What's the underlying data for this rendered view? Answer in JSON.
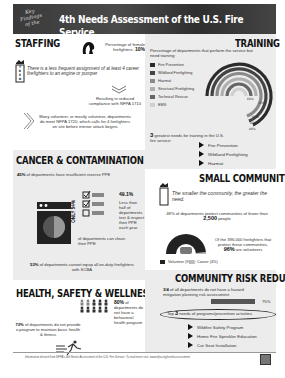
{
  "header": {
    "kicker": "Key Findings of the",
    "title": "4th Needs Assessment of the U.S. Fire Service"
  },
  "staffing": {
    "title": "STAFFING",
    "female_label": "Percentage of female firefighters:",
    "female_value": "10%",
    "trend_badge": "TREND",
    "trend_text": "There is a less frequent assignment of at least 4 career firefighters to an engine or pumper",
    "result_text": "Resulting in reduced compliance with NFPA 1710",
    "volunteer_text": "Many volunteer, or mostly volunteer, departments do meet NFPA 1720, which calls for 4 firefighters on site before interior attack begins"
  },
  "training": {
    "title": "TRAINING",
    "subtitle": "Percentage of departments that perform the service but need training:",
    "legend": [
      {
        "label": "Fire Prevention",
        "color": "#2b2b2b"
      },
      {
        "label": "Wildland Firefighting",
        "color": "#444444"
      },
      {
        "label": "Hazmat",
        "color": "#8a8a8a"
      },
      {
        "label": "Structural Firefighting",
        "color": "#b0b0b0"
      },
      {
        "label": "Technical Rescue",
        "color": "#666666"
      },
      {
        "label": "EMS",
        "color": "#d0d0d0"
      }
    ],
    "ring_values": [
      "86%",
      "85%",
      "83%",
      "68%",
      "63%",
      "58%"
    ],
    "greatest_prefix": "3",
    "greatest_text": "greatest needs for training in the U.S. fire service:",
    "greatest_items": [
      "Fire Prevention",
      "Wildland Firefighting",
      "Hazmat"
    ]
  },
  "cancer": {
    "title": "CANCER & CONTAMINATION",
    "reserve_value": "45%",
    "reserve_text": "of departments have insufficient reserve PPE",
    "checklist_value": "49.1%",
    "checklist_text": "Less than half of departments test & inspect their PPE each year",
    "clean_value": "ONLY 54%",
    "clean_text": "of departments can clean their PPE",
    "scba_value": "53%",
    "scba_text": "of departments cannot equip all on-duty firefighters with SCBA"
  },
  "small_communities": {
    "title": "SMALL COMMUNITIES",
    "trend_badge": "TREND",
    "trend_text": "The smaller the community, the greater the need.",
    "protect_prefix": "48% of departments protect communities of fewer than",
    "protect_value": "2,500",
    "protect_suffix": "people",
    "legend": [
      {
        "label": "Volunteer (96%)",
        "color": "#222222"
      },
      {
        "label": "Career (4%)",
        "color": "#bbbbbb"
      }
    ],
    "volunteer_prefix": "Of the 396,000 firefighters that protect these communities,",
    "volunteer_value": "96%",
    "volunteer_suffix": "are volunteers"
  },
  "health": {
    "title": "HEALTH, SAFETY & WELLNESS",
    "behavioral_value": "80%",
    "behavioral_text": "of departments do not have a behavioral health program",
    "fitness_value": "73%",
    "fitness_text": "of departments do not provide a program to maintain basic health & fitness"
  },
  "crr": {
    "title": "COMMUNITY RISK REDUCTION",
    "hazard_value": "3/4",
    "hazard_text": "of all departments do not have a hazard mitigation planning risk assessment",
    "bar_label": "75%",
    "bar_percent": 75,
    "top_prefix": "Top",
    "top_number": "3",
    "top_text": "needs of programs/prevention activities",
    "items": [
      "Wildfire Safety Program",
      "Home Fire Sprinkler Education",
      "Car Seat Installation"
    ]
  },
  "footer": {
    "text": "Information derived from NFPA's 4th Needs Assessment of the U.S. Fire Service. To read more visit: www.nfpa.org/needsassessment"
  }
}
